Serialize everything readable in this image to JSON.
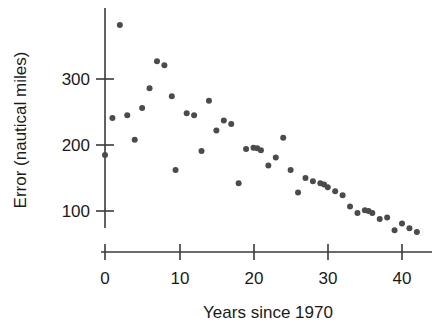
{
  "chart_data": {
    "type": "scatter",
    "title": "",
    "xlabel": "Years since 1970",
    "ylabel": "Error (nautical miles)",
    "xlim": [
      -2,
      44
    ],
    "ylim": [
      40,
      400
    ],
    "xticks": [
      0,
      10,
      20,
      30,
      40
    ],
    "xtick_labels": [
      "0",
      "10",
      "20",
      "30",
      "40"
    ],
    "yticks": [
      100,
      200,
      300
    ],
    "ytick_labels": [
      "100",
      "200",
      "300"
    ],
    "grid": false,
    "legend": null,
    "marker": {
      "shape": "circle",
      "color": "#4b4b4b",
      "size_px": 6
    },
    "series": [
      {
        "name": "Hurricane track forecast error",
        "x": [
          0,
          1,
          2,
          3,
          4,
          5,
          6,
          7,
          8,
          9,
          9.5,
          11,
          12,
          13,
          14,
          15,
          16,
          17,
          18,
          19,
          20,
          20.5,
          21,
          22,
          23,
          24,
          25,
          26,
          27,
          28,
          29,
          29.5,
          30,
          31,
          32,
          33,
          34,
          35,
          35.5,
          36,
          37,
          38,
          39,
          40,
          41,
          42
        ],
        "y": [
          185,
          241,
          382,
          245,
          208,
          256,
          286,
          327,
          321,
          274,
          162,
          248,
          245,
          191,
          267,
          222,
          237,
          232,
          142,
          194,
          196,
          195,
          192,
          169,
          181,
          211,
          162,
          128,
          150,
          145,
          142,
          140,
          136,
          130,
          124,
          107,
          97,
          101,
          100,
          97,
          88,
          90,
          71,
          81,
          74,
          68
        ]
      }
    ]
  },
  "axes": {
    "y_label": "Error (nautical miles)",
    "x_label": "Years since 1970"
  }
}
